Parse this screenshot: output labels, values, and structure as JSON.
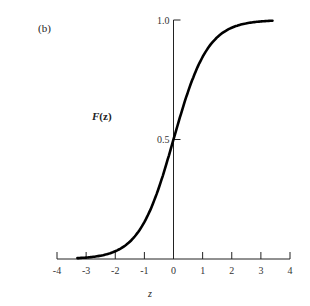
{
  "panel_label": "(b)",
  "chart_data": {
    "type": "line",
    "title": "",
    "xlabel": "z",
    "ylabel": "F(z)",
    "xlim": [
      -4,
      4
    ],
    "ylim": [
      0,
      1.0
    ],
    "x_ticks": [
      "-4",
      "-3",
      "-2",
      "-1",
      "0",
      "1",
      "2",
      "3",
      "4"
    ],
    "y_ticks": [
      "0.5",
      "1.0"
    ],
    "grid": false,
    "legend": "none",
    "series": [
      {
        "name": "F(z)",
        "x": [
          -3.3,
          -3.0,
          -2.5,
          -2.0,
          -1.5,
          -1.0,
          -0.5,
          0.0,
          0.5,
          1.0,
          1.5,
          2.0,
          2.5,
          3.0,
          3.4
        ],
        "values": [
          0.0,
          0.003,
          0.012,
          0.04,
          0.1,
          0.2,
          0.33,
          0.5,
          0.67,
          0.8,
          0.9,
          0.96,
          0.988,
          0.997,
          1.0
        ]
      }
    ]
  },
  "y_tick_labels": {
    "top": "1.0",
    "mid": "0.5"
  },
  "ylabel_parts": {
    "F": "F",
    "arg": "(z)"
  }
}
